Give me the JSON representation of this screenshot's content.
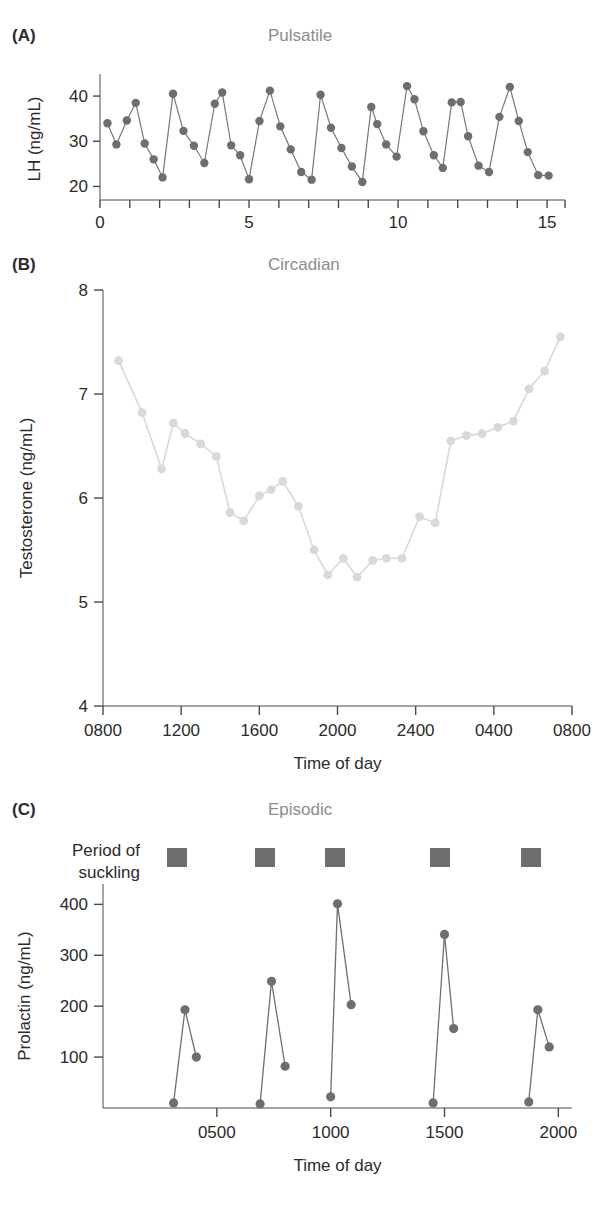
{
  "figure": {
    "panels": [
      {
        "letter": "(A)",
        "title": "Pulsatile"
      },
      {
        "letter": "(B)",
        "title": "Circadian"
      },
      {
        "letter": "(C)",
        "title": "Episodic"
      }
    ]
  },
  "panel_c_annotation": {
    "line1": "Period of",
    "line2": "suckling",
    "marker_color": "#6e6e6e",
    "marker_count": 5,
    "marker_positions_hours": [
      3.25,
      7.1,
      10.2,
      14.8,
      18.8
    ]
  },
  "colors": {
    "panel_a_series": "#6e6e6e",
    "panel_b_series": "#d9d9d9",
    "panel_c_series": "#6e6e6e",
    "axis": "#4a4a4a",
    "title_gray": "#8c8c8c",
    "text": "#2b2b2b",
    "background": "#ffffff"
  },
  "chart_data": [
    {
      "id": "panel-a",
      "type": "line",
      "title": "Pulsatile",
      "xlabel": "",
      "ylabel": "LH (ng/mL)",
      "xlim": [
        0,
        15.6
      ],
      "ylim": [
        17,
        44
      ],
      "xticks": [
        0,
        1,
        2,
        3,
        4,
        5,
        6,
        7,
        8,
        9,
        10,
        11,
        12,
        13,
        14,
        15
      ],
      "xticklabels": [
        "0",
        "",
        "",
        "",
        "",
        "5",
        "",
        "",
        "",
        "",
        "10",
        "",
        "",
        "",
        "",
        "15"
      ],
      "yticks": [
        20,
        30,
        40
      ],
      "yticklabels": [
        "20",
        "30",
        "40"
      ],
      "grid": false,
      "legend": "none",
      "marker": "filled-circle",
      "x": [
        0.25,
        0.55,
        0.9,
        1.2,
        1.5,
        1.8,
        2.1,
        2.45,
        2.8,
        3.15,
        3.5,
        3.85,
        4.1,
        4.4,
        4.7,
        5.0,
        5.35,
        5.7,
        6.05,
        6.4,
        6.75,
        7.1,
        7.4,
        7.75,
        8.1,
        8.45,
        8.8,
        9.1,
        9.3,
        9.6,
        9.95,
        10.3,
        10.55,
        10.85,
        11.2,
        11.5,
        11.8,
        12.1,
        12.35,
        12.7,
        13.05,
        13.4,
        13.75,
        14.05,
        14.35,
        14.7,
        15.05
      ],
      "y": [
        34.0,
        29.3,
        34.6,
        38.5,
        29.5,
        26.0,
        22.0,
        40.5,
        32.3,
        29.0,
        25.2,
        38.3,
        40.8,
        29.1,
        26.9,
        21.6,
        34.5,
        41.2,
        33.3,
        28.2,
        23.2,
        21.5,
        40.3,
        33.0,
        28.5,
        24.4,
        21.0,
        37.6,
        33.8,
        29.3,
        26.6,
        42.2,
        39.3,
        32.2,
        26.9,
        24.1,
        38.6,
        38.7,
        31.1,
        24.6,
        23.2,
        35.4,
        42.0,
        34.5,
        27.6,
        22.5,
        22.4
      ]
    },
    {
      "id": "panel-b",
      "type": "line",
      "title": "Circadian",
      "xlabel": "Time of day",
      "ylabel": "Testosterone (ng/mL)",
      "xlim": [
        800,
        3200
      ],
      "ylim": [
        4,
        8
      ],
      "xticks": [
        800,
        1200,
        1600,
        2000,
        2400,
        2800,
        3200
      ],
      "xticklabels": [
        "0800",
        "1200",
        "1600",
        "2000",
        "2400",
        "0400",
        "0800"
      ],
      "yticks": [
        4,
        5,
        6,
        7,
        8
      ],
      "yticklabels": [
        "4",
        "5",
        "6",
        "7",
        "8"
      ],
      "grid": false,
      "legend": "none",
      "marker": "filled-circle",
      "x": [
        880,
        1000,
        1100,
        1160,
        1220,
        1300,
        1380,
        1450,
        1520,
        1600,
        1660,
        1720,
        1800,
        1880,
        1950,
        2030,
        2100,
        2180,
        2250,
        2330,
        2420,
        2500,
        2580,
        2660,
        2740,
        2820,
        2900,
        2980,
        3060,
        3140
      ],
      "y": [
        7.32,
        6.82,
        6.28,
        6.72,
        6.62,
        6.52,
        6.4,
        5.86,
        5.78,
        6.02,
        6.08,
        6.16,
        5.92,
        5.5,
        5.26,
        5.42,
        5.24,
        5.4,
        5.42,
        5.42,
        5.82,
        5.76,
        6.55,
        6.6,
        6.62,
        6.68,
        6.74,
        7.05,
        7.22,
        7.55
      ]
    },
    {
      "id": "panel-c",
      "type": "line",
      "title": "Episodic",
      "xlabel": "Time of day",
      "ylabel": "Prolactin (ng/mL)",
      "xlim": [
        0,
        20.6
      ],
      "ylim": [
        0,
        440
      ],
      "xticks": [
        5,
        10,
        15,
        20
      ],
      "xticklabels": [
        "0500",
        "1000",
        "1500",
        "2000"
      ],
      "yticks": [
        100,
        200,
        300,
        400
      ],
      "yticklabels": [
        "100",
        "200",
        "300",
        "400"
      ],
      "grid": false,
      "legend": "none",
      "marker": "filled-circle",
      "episodes": [
        {
          "x": [
            3.1,
            3.6,
            4.1
          ],
          "y": [
            10,
            193,
            100
          ]
        },
        {
          "x": [
            6.9,
            7.4,
            8.0
          ],
          "y": [
            8,
            249,
            82
          ]
        },
        {
          "x": [
            10.0,
            10.3,
            10.9
          ],
          "y": [
            22,
            401,
            203
          ]
        },
        {
          "x": [
            14.5,
            15.0,
            15.4
          ],
          "y": [
            10,
            341,
            156
          ]
        },
        {
          "x": [
            18.7,
            19.1,
            19.6
          ],
          "y": [
            12,
            193,
            120
          ]
        }
      ]
    }
  ]
}
